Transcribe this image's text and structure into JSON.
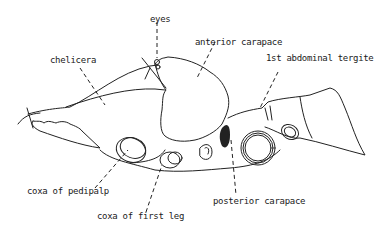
{
  "diagram": {
    "labels": {
      "eyes": "eyes",
      "chelicera": "chelicera",
      "anterior_carapace": "anterior carapace",
      "first_abdominal_tergite": "1st abdominal tergite",
      "coxa_of_pedipalp": "coxa of pedipalp",
      "coxa_of_first_leg": "coxa of first leg",
      "posterior_carapace": "posterior carapace"
    },
    "colors": {
      "line": "#222222",
      "background": "#ffffff"
    }
  }
}
